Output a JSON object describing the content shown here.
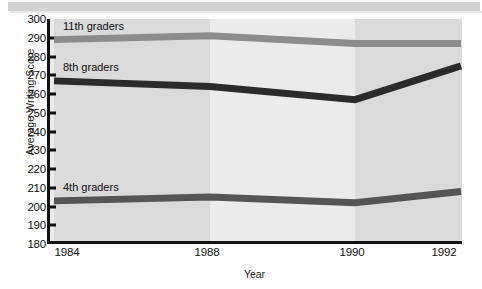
{
  "chart_data": {
    "type": "line",
    "title": "",
    "xlabel": "Year",
    "ylabel": "Average Writing Score",
    "x": [
      1984,
      1988,
      1990,
      1992
    ],
    "xtick_labels": [
      "1984",
      "1988",
      "1990",
      "1992"
    ],
    "ylim": [
      180,
      300
    ],
    "ytick_labels": [
      "300",
      "290",
      "280",
      "270",
      "260",
      "250",
      "240",
      "230",
      "220",
      "210",
      "200",
      "190",
      "180"
    ],
    "yticks": [
      300,
      290,
      280,
      270,
      260,
      250,
      240,
      230,
      220,
      210,
      200,
      190,
      180
    ],
    "grid": false,
    "legend_position": "inline-labels",
    "series": [
      {
        "name": "11th graders",
        "label": "11th graders",
        "color": "#8c8c8c",
        "values": [
          289,
          291,
          287,
          287
        ]
      },
      {
        "name": "8th graders",
        "label": "8th graders",
        "color": "#2b2b2b",
        "values": [
          267,
          264,
          257,
          275
        ]
      },
      {
        "name": "4th graders",
        "label": "4th graders",
        "color": "#555555",
        "values": [
          203,
          205,
          202,
          208
        ]
      }
    ]
  },
  "axis": {
    "y_title": "Average Writing Score",
    "x_title": "Year"
  },
  "colors": {
    "plot_background": "#e2e2e2",
    "axis": "#111111",
    "page_background": "#ffffff",
    "top_band": "#d2d2d2"
  }
}
